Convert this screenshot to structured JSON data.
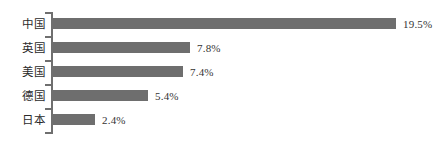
{
  "chart_data": {
    "type": "bar",
    "orientation": "horizontal",
    "title": "",
    "subtitle": "",
    "xlabel": "",
    "ylabel": "",
    "categories": [
      "中国",
      "英国",
      "美国",
      "德国",
      "日本"
    ],
    "values": [
      19.5,
      7.8,
      7.4,
      5.4,
      2.4
    ],
    "value_labels": [
      "19.5%",
      "7.8%",
      "7.4%",
      "5.4%",
      "2.4%"
    ],
    "xlim": [
      0,
      19.5
    ],
    "grid": false,
    "legend": null,
    "series": [
      {
        "name": "",
        "values": [
          19.5,
          7.8,
          7.4,
          5.4,
          2.4
        ]
      }
    ],
    "bars": [
      {
        "category": "中国",
        "value": 19.5,
        "label": "19.5%"
      },
      {
        "category": "英国",
        "value": 7.8,
        "label": "7.8%"
      },
      {
        "category": "美国",
        "value": 7.4,
        "label": "7.4%"
      },
      {
        "category": "德国",
        "value": 5.4,
        "label": "5.4%"
      },
      {
        "category": "日本",
        "value": 2.4,
        "label": "2.4%"
      }
    ]
  },
  "colors": {
    "bar_fill": "#6e6e6e",
    "axis": "#6f6f6f",
    "background": "#ffffff",
    "label_text": "#2b2b2b",
    "value_text": "#333333"
  }
}
